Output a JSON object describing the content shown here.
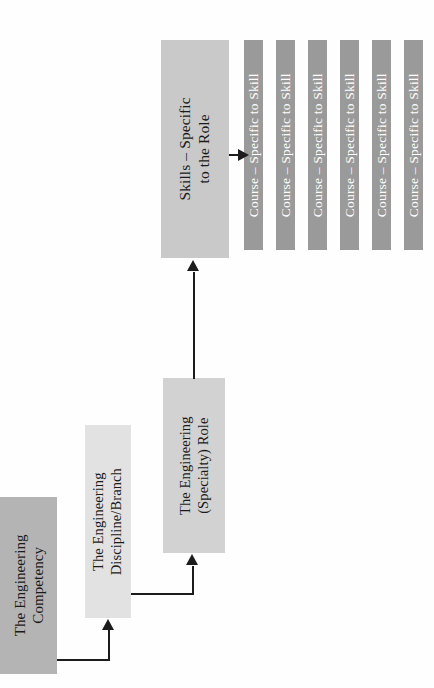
{
  "diagram": {
    "orientation": "rotated-90-ccw",
    "colors": {
      "competency_fill": "#b4b4b4",
      "discipline_fill": "#e2e2e2",
      "role_fill": "#d2d2d2",
      "skills_fill": "#c9c9c9",
      "course_fill": "#9a9a9a",
      "course_text": "#ffffff",
      "node_text": "#1a1a1a",
      "connector": "#1c1c1c",
      "background": "#fefefe"
    },
    "nodes": [
      {
        "id": "competency",
        "label_line1": "The Engineering",
        "label_line2": "Competency"
      },
      {
        "id": "discipline",
        "label_line1": "The Engineering",
        "label_line2": "Discipline/Branch"
      },
      {
        "id": "role",
        "label_line1": "The Engineering",
        "label_line2": "(Specialty) Role"
      },
      {
        "id": "skills",
        "label_line1": "Skills – Specific",
        "label_line2": "to the Role"
      }
    ],
    "courses": [
      {
        "id": "course-1",
        "label": "Course – Specific to Skill"
      },
      {
        "id": "course-2",
        "label": "Course – Specific to Skill"
      },
      {
        "id": "course-3",
        "label": "Course – Specific to Skill"
      },
      {
        "id": "course-4",
        "label": "Course – Specific to Skill"
      },
      {
        "id": "course-5",
        "label": "Course – Specific to Skill"
      },
      {
        "id": "course-6",
        "label": "Course – Specific to Skill"
      }
    ],
    "connectors": [
      {
        "id": "competency-to-discipline",
        "type": "elbow-up"
      },
      {
        "id": "discipline-to-role",
        "type": "elbow-up"
      },
      {
        "id": "role-to-skills",
        "type": "straight-up"
      },
      {
        "id": "skills-to-course",
        "type": "straight-right"
      }
    ]
  }
}
